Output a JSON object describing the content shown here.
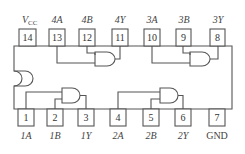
{
  "diagram": {
    "colors": {
      "line": "#555555",
      "text": "#444444",
      "background": "#ffffff"
    },
    "top_pins": [
      {
        "number": "14",
        "label": "V",
        "sub": "CC"
      },
      {
        "number": "13",
        "label": "4A"
      },
      {
        "number": "12",
        "label": "4B"
      },
      {
        "number": "11",
        "label": "4Y"
      },
      {
        "number": "10",
        "label": "3A"
      },
      {
        "number": "9",
        "label": "3B"
      },
      {
        "number": "8",
        "label": "3Y"
      }
    ],
    "bottom_pins": [
      {
        "number": "1",
        "label": "1A"
      },
      {
        "number": "2",
        "label": "1B"
      },
      {
        "number": "3",
        "label": "1Y"
      },
      {
        "number": "4",
        "label": "2A"
      },
      {
        "number": "5",
        "label": "2B"
      },
      {
        "number": "6",
        "label": "2Y"
      },
      {
        "number": "7",
        "label": "GND"
      }
    ],
    "gates": [
      {
        "name": "gate-1",
        "type": "AND",
        "inputs": [
          "1A",
          "1B"
        ],
        "output": "1Y"
      },
      {
        "name": "gate-2",
        "type": "AND",
        "inputs": [
          "2A",
          "2B"
        ],
        "output": "2Y"
      },
      {
        "name": "gate-3",
        "type": "AND",
        "inputs": [
          "3A",
          "3B"
        ],
        "output": "3Y"
      },
      {
        "name": "gate-4",
        "type": "AND",
        "inputs": [
          "4A",
          "4B"
        ],
        "output": "4Y"
      }
    ]
  }
}
